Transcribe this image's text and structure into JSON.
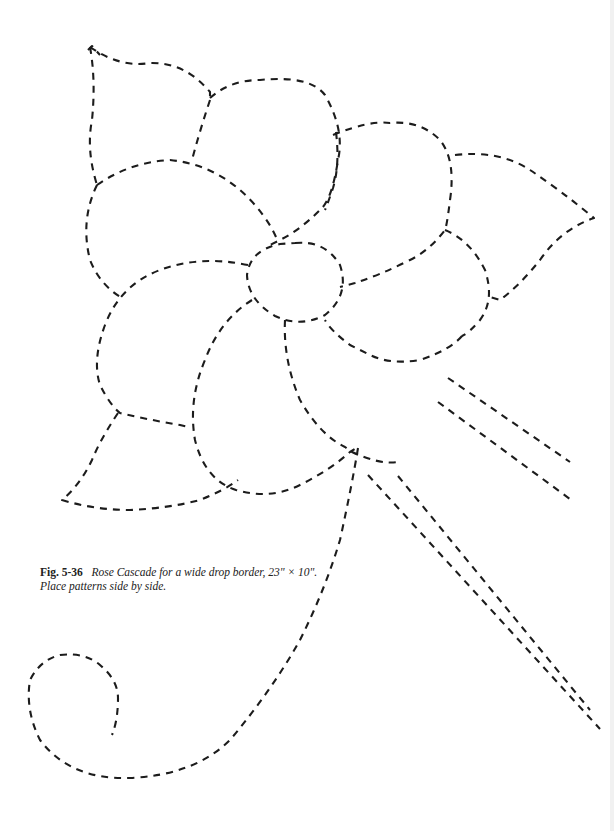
{
  "figure": {
    "label": "Fig. 5-36",
    "caption": "Rose Cascade for a wide drop border, 23\" × 10\". Place patterns side by side.",
    "line_style": "dashed-outline",
    "ink_color": "#1c1c1c",
    "components": [
      "upper-left-leaf",
      "top-petal",
      "upper-right-petal",
      "right-leaf",
      "right-petal",
      "center-circle",
      "left-upper-petal",
      "left-lower-petal",
      "bottom-petal",
      "lower-left-leaf",
      "stems",
      "curl-tendril"
    ]
  }
}
